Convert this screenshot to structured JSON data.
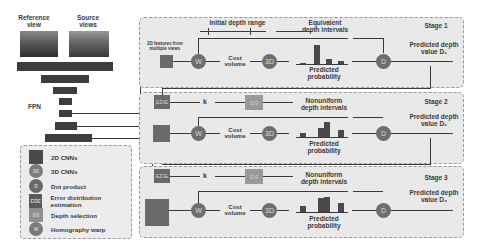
{
  "inputs": {
    "reference_label": "Reference view",
    "source_label": "Source views"
  },
  "fpn_label": "FPN",
  "legend": {
    "items": [
      {
        "icon": "square-2d",
        "glyph": "",
        "label": "2D CNNs"
      },
      {
        "icon": "circle-3d",
        "glyph": "3D",
        "label": "3D CNNs"
      },
      {
        "icon": "circle-d",
        "glyph": "D",
        "label": "Dot product"
      },
      {
        "icon": "square-ede",
        "glyph": "EDE",
        "label": "Error distribution estimation"
      },
      {
        "icon": "square-ds",
        "glyph": "DS",
        "label": "Depth selection"
      },
      {
        "icon": "circle-w",
        "glyph": "W",
        "label": "Homography warp"
      }
    ]
  },
  "stage1": {
    "title": "Stage 1",
    "initial_range": "Initial depth range",
    "features_label": "2D features from multiple views",
    "warp": "W",
    "cost_volume": "Cost volume",
    "cnn3d": "3D",
    "intervals": "Equivalent depth intervals",
    "probability": "Predicted probability",
    "dot": "D",
    "pred": "Predicted depth value D₁"
  },
  "stage2": {
    "title": "Stage 2",
    "ede": "EDE",
    "k": "k",
    "ds": "DS",
    "warp": "W",
    "cost_volume": "Cost volume",
    "cnn3d": "3D",
    "intervals": "Nonuniform depth intervals",
    "probability": "Predicted probability",
    "dot": "D",
    "pred": "Predicted depth value D₂"
  },
  "stage3": {
    "title": "Stage 3",
    "ede": "EDE",
    "k": "k",
    "ds": "DS",
    "warp": "W",
    "cost_volume": "Cost volume",
    "cnn3d": "3D",
    "intervals": "Nonuniform depth intervals",
    "probability": "Predicted probability",
    "dot": "D",
    "pred": "Predicted depth value D₃"
  },
  "colors": {
    "stage_bg": "#e9e9e9",
    "node": "#6e6e6e",
    "ds_node": "#999999",
    "fpn_bar": "#3d3d3d"
  }
}
